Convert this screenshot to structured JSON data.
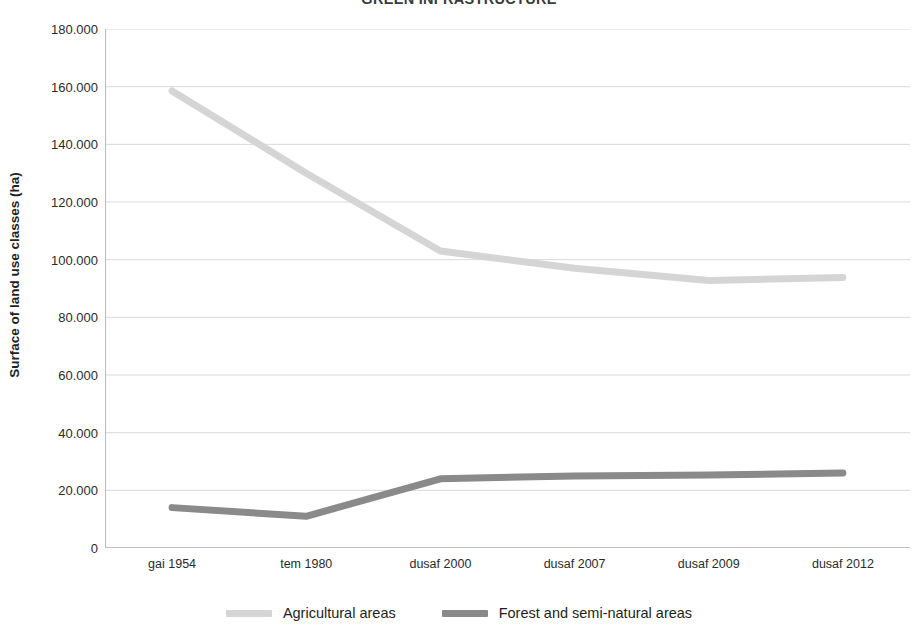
{
  "chart_data": {
    "type": "line",
    "title": "GREEN INFRASTRUCTURE",
    "xlabel": "",
    "ylabel": "Surface of land use classes (ha)",
    "categories": [
      "gai 1954",
      "tem 1980",
      "dusaf 2000",
      "dusaf 2007",
      "dusaf 2009",
      "dusaf 2012"
    ],
    "series": [
      {
        "name": "Agricultural areas",
        "color": "#d5d5d5",
        "values": [
          158500,
          130000,
          103000,
          97000,
          92800,
          93800
        ]
      },
      {
        "name": "Forest and semi-natural areas",
        "color": "#8a8a8a",
        "values": [
          14000,
          11000,
          24000,
          25000,
          25300,
          26000
        ]
      }
    ],
    "ylim": [
      0,
      180000
    ],
    "ytick_step": 20000,
    "ytick_labels": [
      "180.000",
      "160.000",
      "140.000",
      "120.000",
      "100.000",
      "80.000",
      "60.000",
      "40.000",
      "20.000",
      "0"
    ],
    "ytick_values": [
      180000,
      160000,
      140000,
      120000,
      100000,
      80000,
      60000,
      40000,
      20000,
      0
    ],
    "grid": true,
    "grid_color": "#d9d9d9",
    "axis_color": "#bfbfbf",
    "legend_position": "bottom",
    "line_width": 7
  }
}
